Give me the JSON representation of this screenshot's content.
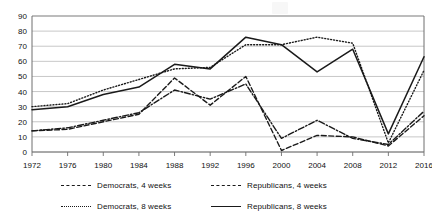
{
  "chart_data": {
    "type": "line",
    "title": "",
    "subtitle": "",
    "xlabel": "",
    "ylabel": "",
    "x": [
      1972,
      1976,
      1980,
      1984,
      1988,
      1992,
      1996,
      2000,
      2004,
      2008,
      2012,
      2016
    ],
    "xtick_labels": [
      "1972",
      "1976",
      "1980",
      "1984",
      "1988",
      "1992",
      "1996",
      "2000",
      "2004",
      "2008",
      "2012",
      "2016"
    ],
    "ytick_labels": [
      "0",
      "10",
      "20",
      "30",
      "40",
      "50",
      "60",
      "70",
      "80",
      "90"
    ],
    "yticks": [
      0,
      10,
      20,
      30,
      40,
      50,
      60,
      70,
      80,
      90
    ],
    "ylim": [
      0,
      90
    ],
    "xlim": [
      1972,
      2016
    ],
    "grid": "horizontal",
    "legend_position": "bottom",
    "series": [
      {
        "name": "Democrats, 4 weeks",
        "style": "dash-dot",
        "color": "#1a1a1a",
        "values": [
          14,
          16,
          21,
          26,
          41,
          35,
          45,
          9,
          21,
          9,
          5,
          27
        ]
      },
      {
        "name": "Republicans, 4 weeks",
        "style": "dashed",
        "color": "#1a1a1a",
        "values": [
          14,
          15,
          20,
          25,
          49,
          31,
          50,
          1,
          11,
          10,
          4,
          24
        ]
      },
      {
        "name": "Democrats, 8 weeks",
        "style": "dotted",
        "color": "#1a1a1a",
        "values": [
          30,
          32,
          41,
          48,
          55,
          56,
          71,
          71,
          76,
          72,
          6,
          54
        ]
      },
      {
        "name": "Republicans, 8 weeks",
        "style": "solid",
        "color": "#1a1a1a",
        "values": [
          28,
          30,
          38,
          43,
          58,
          55,
          76,
          71,
          53,
          68,
          12,
          63
        ]
      }
    ]
  },
  "legend": {
    "items": [
      {
        "label": "Democrats, 4 weeks",
        "style": "dash-dot"
      },
      {
        "label": "Republicans, 4 weeks",
        "style": "dashed"
      },
      {
        "label": "Democrats, 8 weeks",
        "style": "dotted"
      },
      {
        "label": "Republicans, 8 weeks",
        "style": "solid"
      }
    ]
  },
  "axes": {
    "y_axis_name": "y-axis",
    "x_axis_name": "x-axis"
  }
}
